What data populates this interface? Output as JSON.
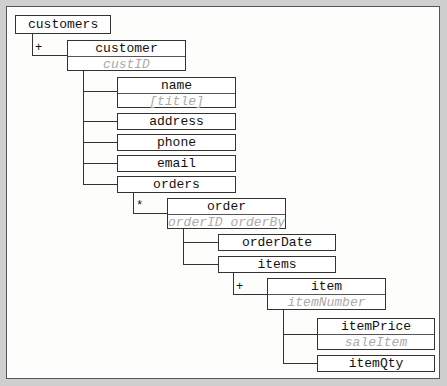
{
  "diagram": {
    "nodes": [
      {
        "id": "customers",
        "label": "customers",
        "attrs": ""
      },
      {
        "id": "customer",
        "label": "customer",
        "attrs": "custID",
        "cardinality": "+"
      },
      {
        "id": "name",
        "label": "name",
        "attrs": "[title]"
      },
      {
        "id": "address",
        "label": "address",
        "attrs": ""
      },
      {
        "id": "phone",
        "label": "phone",
        "attrs": ""
      },
      {
        "id": "email",
        "label": "email",
        "attrs": ""
      },
      {
        "id": "orders",
        "label": "orders",
        "attrs": ""
      },
      {
        "id": "order",
        "label": "order",
        "attrs": "orderID orderBy",
        "cardinality": "*"
      },
      {
        "id": "orderDate",
        "label": "orderDate",
        "attrs": ""
      },
      {
        "id": "items",
        "label": "items",
        "attrs": ""
      },
      {
        "id": "item",
        "label": "item",
        "attrs": "itemNumber",
        "cardinality": "+"
      },
      {
        "id": "itemPrice",
        "label": "itemPrice",
        "attrs": "saleItem"
      },
      {
        "id": "itemQty",
        "label": "itemQty",
        "attrs": ""
      }
    ],
    "edges": [
      [
        "customers",
        "customer"
      ],
      [
        "customer",
        "name"
      ],
      [
        "customer",
        "address"
      ],
      [
        "customer",
        "phone"
      ],
      [
        "customer",
        "email"
      ],
      [
        "customer",
        "orders"
      ],
      [
        "orders",
        "order"
      ],
      [
        "order",
        "orderDate"
      ],
      [
        "order",
        "items"
      ],
      [
        "items",
        "item"
      ],
      [
        "item",
        "itemPrice"
      ],
      [
        "item",
        "itemQty"
      ]
    ],
    "markers": {
      "customer": "+",
      "order": "*",
      "item": "+"
    }
  }
}
